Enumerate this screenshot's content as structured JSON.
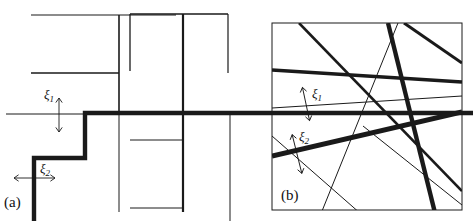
{
  "figure": {
    "title": "",
    "background": "#ffffff",
    "ink_color": "#1a1a1a",
    "panels": [
      {
        "id": "a",
        "label": "(a)",
        "kind": "rectilinear-line-process",
        "annotations": [
          {
            "name": "xi1",
            "text": "ξ",
            "sub": "1",
            "measures": "horizontal-segment-thickness",
            "arrow": "vertical-double-headed"
          },
          {
            "name": "xi2",
            "text": "ξ",
            "sub": "2",
            "measures": "vertical-segment-thickness",
            "arrow": "horizontal-double-headed"
          }
        ]
      },
      {
        "id": "b",
        "label": "(b)",
        "kind": "random-line-process",
        "annotations": [
          {
            "name": "xi1",
            "text": "ξ",
            "sub": "1",
            "measures": "thin-line-thickness",
            "arrow": "vertical-double-headed"
          },
          {
            "name": "xi2",
            "text": "ξ",
            "sub": "2",
            "measures": "thick-line-thickness",
            "arrow": "vertical-double-headed"
          }
        ]
      }
    ]
  },
  "chart_data": {
    "type": "diagram",
    "title": "",
    "xlabel": "",
    "ylabel": "",
    "panel_a": {
      "label": "(a)",
      "description": "Rectilinear (Manhattan) line segments of varying widths; a bold staircase path runs from lower-left to the right.",
      "segments": [
        {
          "name": "seg-a-1",
          "orient": "h",
          "x1": 31,
          "y1": 15,
          "x2": 119,
          "y2": 15,
          "w": 1.2
        },
        {
          "name": "seg-a-2",
          "orient": "h",
          "x1": 119,
          "y1": 15,
          "x2": 176,
          "y2": 15,
          "w": 1.2
        },
        {
          "name": "seg-a-3",
          "orient": "v",
          "x1": 119,
          "y1": 15,
          "x2": 119,
          "y2": 113,
          "w": 1.6
        },
        {
          "name": "seg-a-4",
          "orient": "h",
          "x1": 31,
          "y1": 73,
          "x2": 119,
          "y2": 73,
          "w": 1.4
        },
        {
          "name": "seg-a-5",
          "orient": "h",
          "x1": 130,
          "y1": 14,
          "x2": 228,
          "y2": 14,
          "w": 1.3
        },
        {
          "name": "seg-a-6",
          "orient": "v",
          "x1": 130,
          "y1": 14,
          "x2": 130,
          "y2": 71,
          "w": 1.3
        },
        {
          "name": "seg-a-7",
          "orient": "v",
          "x1": 228,
          "y1": 14,
          "x2": 228,
          "y2": 73,
          "w": 1.2
        },
        {
          "name": "seg-a-8",
          "orient": "v",
          "x1": 183,
          "y1": 14,
          "x2": 183,
          "y2": 212,
          "w": 2.2
        },
        {
          "name": "seg-a-9",
          "orient": "h",
          "x1": 6,
          "y1": 114,
          "x2": 85,
          "y2": 114,
          "w": 1.0
        },
        {
          "name": "seg-a-10",
          "orient": "v",
          "x1": 119,
          "y1": 114,
          "x2": 119,
          "y2": 212,
          "w": 1.0
        },
        {
          "name": "seg-a-11",
          "orient": "h",
          "x1": 130,
          "y1": 140,
          "x2": 183,
          "y2": 140,
          "w": 1.0
        },
        {
          "name": "seg-a-12",
          "orient": "h",
          "x1": 130,
          "y1": 208,
          "x2": 183,
          "y2": 208,
          "w": 1.0
        },
        {
          "name": "seg-a-13",
          "orient": "v",
          "x1": 230,
          "y1": 113,
          "x2": 230,
          "y2": 221,
          "w": 1.0
        }
      ],
      "bold_path": {
        "name": "staircase-path",
        "w": 4.4,
        "points": [
          [
            34,
            221
          ],
          [
            34,
            158
          ],
          [
            85,
            158
          ],
          [
            85,
            113
          ],
          [
            473,
            113
          ]
        ]
      },
      "bold_path_right_extent": 473
    },
    "panel_b": {
      "label": "(b)",
      "description": "Isotropic random lines crossing a square window, widths from hairline to bold.",
      "box": {
        "x": 272,
        "y": 23,
        "w": 190,
        "h": 187,
        "stroke": 1.0
      },
      "lines": [
        {
          "name": "line-b-1",
          "x1": 272,
          "y1": 70,
          "x2": 462,
          "y2": 82,
          "w": 3.6
        },
        {
          "name": "line-b-2",
          "x1": 272,
          "y1": 108,
          "x2": 462,
          "y2": 96,
          "w": 1.0
        },
        {
          "name": "line-b-3",
          "x1": 272,
          "y1": 156,
          "x2": 462,
          "y2": 112,
          "w": 5.0
        },
        {
          "name": "line-b-4",
          "x1": 299,
          "y1": 23,
          "x2": 462,
          "y2": 191,
          "w": 2.6
        },
        {
          "name": "line-b-5",
          "x1": 388,
          "y1": 23,
          "x2": 437,
          "y2": 221,
          "w": 4.4
        },
        {
          "name": "line-b-6",
          "x1": 398,
          "y1": 23,
          "x2": 318,
          "y2": 221,
          "w": 1.0
        },
        {
          "name": "line-b-7",
          "x1": 404,
          "y1": 23,
          "x2": 462,
          "y2": 63,
          "w": 3.0
        },
        {
          "name": "line-b-8",
          "x1": 363,
          "y1": 126,
          "x2": 462,
          "y2": 205,
          "w": 1.0
        },
        {
          "name": "line-b-9",
          "x1": 272,
          "y1": 136,
          "x2": 369,
          "y2": 221,
          "w": 1.0
        }
      ]
    }
  }
}
